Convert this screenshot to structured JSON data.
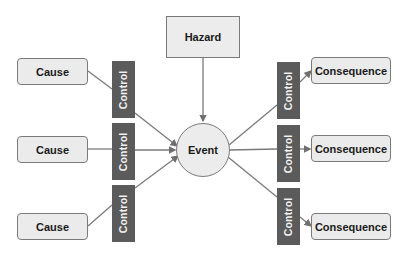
{
  "diagram": {
    "type": "bowtie",
    "hazard": {
      "label": "Hazard"
    },
    "event": {
      "label": "Event"
    },
    "causes": [
      {
        "label": "Cause"
      },
      {
        "label": "Cause"
      },
      {
        "label": "Cause"
      }
    ],
    "left_controls": [
      {
        "label": "Control"
      },
      {
        "label": "Control"
      },
      {
        "label": "Control"
      }
    ],
    "right_controls": [
      {
        "label": "Control"
      },
      {
        "label": "Control"
      },
      {
        "label": "Control"
      }
    ],
    "consequences": [
      {
        "label": "Consequence"
      },
      {
        "label": "Consequence"
      },
      {
        "label": "Consequence"
      }
    ],
    "colors": {
      "box_fill": "#ebebeb",
      "box_border": "#7a7a7a",
      "control_fill": "#5b5b5b",
      "control_text": "#f2f2f2",
      "connector": "#777777"
    }
  }
}
